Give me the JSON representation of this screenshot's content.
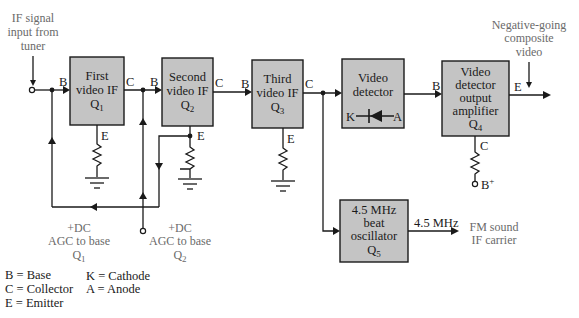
{
  "diagram": {
    "input_note": [
      "IF signal",
      "input from",
      "tuner"
    ],
    "output_note": [
      "Negative-going",
      "composite",
      "video"
    ],
    "blocks": [
      {
        "id": "q1",
        "lines": [
          "First",
          "video IF"
        ],
        "device": "Q",
        "sub": "1"
      },
      {
        "id": "q2",
        "lines": [
          "Second",
          "video IF"
        ],
        "device": "Q",
        "sub": "2"
      },
      {
        "id": "q3",
        "lines": [
          "Third",
          "video IF"
        ],
        "device": "Q",
        "sub": "3"
      },
      {
        "id": "detector",
        "lines": [
          "Video",
          "detector"
        ],
        "diode_k": "K",
        "diode_a": "A"
      },
      {
        "id": "q4",
        "lines": [
          "Video",
          "detector",
          "output",
          "amplifier"
        ],
        "device": "Q",
        "sub": "4"
      },
      {
        "id": "q5",
        "lines": [
          "4.5 MHz",
          "beat",
          "oscillator"
        ],
        "device": "Q",
        "sub": "5"
      }
    ],
    "terminal_labels": {
      "q1_base": "B",
      "q1_collector": "C",
      "q1_emitter": "E",
      "q2_base": "B",
      "q2_collector": "C",
      "q2_emitter": "E",
      "q3_base": "B",
      "q3_collector": "C",
      "q3_emitter": "E",
      "q4_base": "B",
      "q4_emitter": "E",
      "q4_collector": "C",
      "supply": "B",
      "supply_sup": "+"
    },
    "agc_q1": {
      "lines": [
        "+DC",
        "AGC to base"
      ],
      "device": "Q",
      "sub": "1"
    },
    "agc_q2": {
      "lines": [
        "+DC",
        "AGC to base"
      ],
      "device": "Q",
      "sub": "2"
    },
    "oscillator_output_label": "4.5 MHz",
    "fm_note": [
      "FM sound",
      "IF carrier"
    ]
  },
  "legend": {
    "left": [
      "B = Base",
      "C = Collector",
      "E = Emitter"
    ],
    "right": [
      "K = Cathode",
      "A = Anode"
    ]
  },
  "colors": {
    "block_fill": "#c4c4c4",
    "line": "#1a1a1a",
    "note_text": "#6a6a6a"
  }
}
